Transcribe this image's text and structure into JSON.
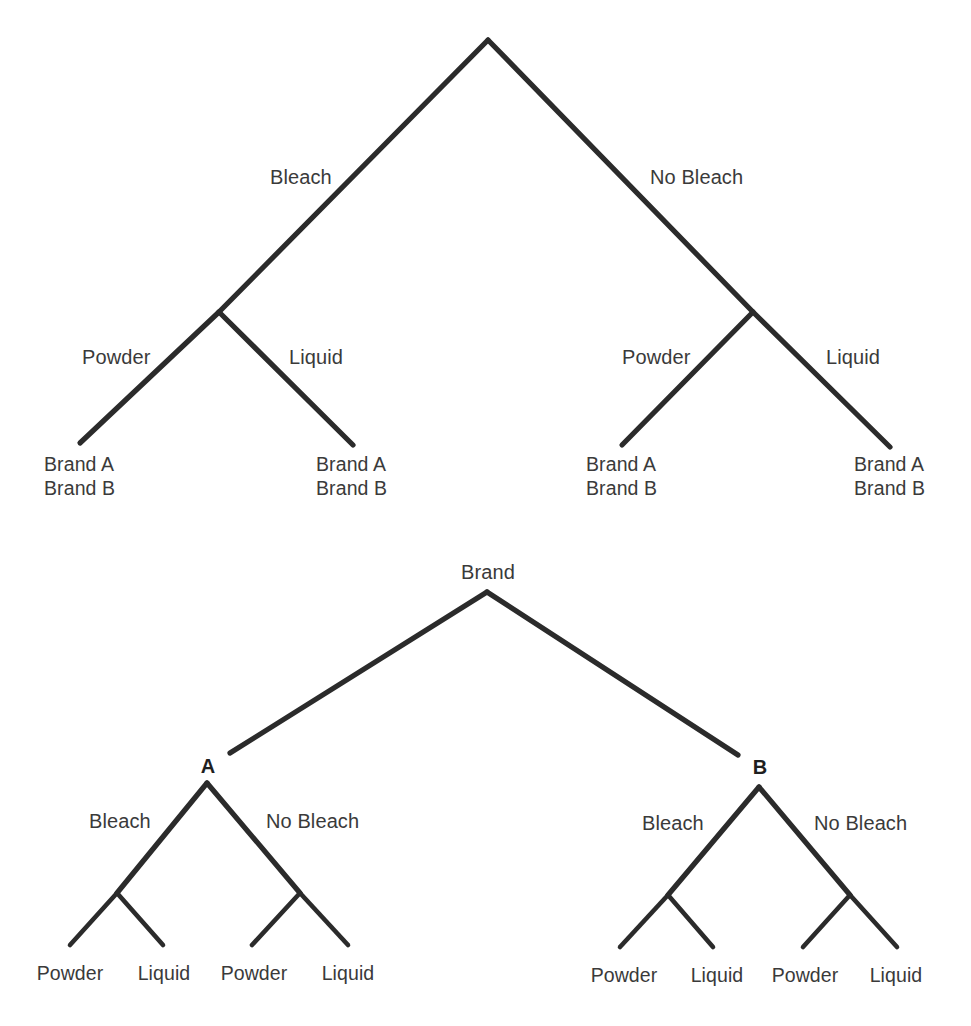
{
  "diagram": {
    "type": "tree-diagram-pair",
    "title": "",
    "background_color": "#ffffff",
    "line_color": "#2b2b2b",
    "text_color": "#3a3a3a"
  },
  "top_tree": {
    "name": "bleach-first-split-tree",
    "root_label": "",
    "level1": [
      {
        "label": "Bleach"
      },
      {
        "label": "No Bleach"
      }
    ],
    "level2": [
      {
        "label": "Powder"
      },
      {
        "label": "Liquid"
      },
      {
        "label": "Powder"
      },
      {
        "label": "Liquid"
      }
    ],
    "leaves": [
      {
        "line1": "Brand A",
        "line2": "Brand B"
      },
      {
        "line1": "Brand A",
        "line2": "Brand B"
      },
      {
        "line1": "Brand A",
        "line2": "Brand B"
      },
      {
        "line1": "Brand A",
        "line2": "Brand B"
      }
    ]
  },
  "bottom_tree": {
    "name": "brand-first-split-tree",
    "root_label": "Brand",
    "level1": [
      {
        "label": "A"
      },
      {
        "label": "B"
      }
    ],
    "level2": [
      {
        "label": "Bleach"
      },
      {
        "label": "No Bleach"
      },
      {
        "label": "Bleach"
      },
      {
        "label": "No Bleach"
      }
    ],
    "leaves": [
      {
        "label": "Powder"
      },
      {
        "label": "Liquid"
      },
      {
        "label": "Powder"
      },
      {
        "label": "Liquid"
      },
      {
        "label": "Powder"
      },
      {
        "label": "Liquid"
      },
      {
        "label": "Powder"
      },
      {
        "label": "Liquid"
      }
    ]
  }
}
